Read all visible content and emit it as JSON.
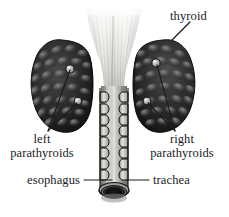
{
  "figure": {
    "background_color": "#ffffff",
    "width": 229,
    "height": 217,
    "style": "grayscale anatomical engraving"
  },
  "labels": {
    "thyroid": "thyroid",
    "left_parathyroids_line1": "left",
    "left_parathyroids_line2": "parathyroids",
    "right_parathyroids_line1": "right",
    "right_parathyroids_line2": "parathyroids",
    "esophagus": "esophagus",
    "trachea": "trachea"
  },
  "colors": {
    "text": "#1a1a1a",
    "leader_line": "#1c1c1c",
    "thyroid_lobe_dark": "#1b1b1b",
    "thyroid_lobe_mid": "#3a3a3a",
    "thyroid_lobe_highlight": "#6e6e6e",
    "cartilage_light": "#d8d8d4",
    "cartilage_mid": "#a9a9a5",
    "trachea_tube": "#8e8e8a",
    "trachea_tube_highlight": "#cfcfcb",
    "trachea_lumen": "#0d0d0d",
    "parathyroid_nodule": "#b9b9b4",
    "outline": "#1a1a1a"
  },
  "structures": [
    {
      "name": "thyroid-cartilage-funnel",
      "label": "thyroid",
      "description": "Flared fibrous funnel-shaped cartilage at top with vertical striations",
      "position": "top-center"
    },
    {
      "name": "thyroid-lobe-left",
      "label": "thyroid",
      "description": "Dark lobulated glandular mass on viewer-left side",
      "position": "upper-left"
    },
    {
      "name": "thyroid-lobe-right",
      "label": "thyroid",
      "description": "Dark lobulated glandular mass on viewer-right side",
      "position": "upper-right"
    },
    {
      "name": "parathyroid-left-superior",
      "label": "left parathyroids",
      "description": "Pale round nodule embedded in left lobe, superior",
      "position": "left-lobe-upper"
    },
    {
      "name": "parathyroid-left-inferior",
      "label": "left parathyroids",
      "description": "Pale round nodule embedded in left lobe, inferior",
      "position": "left-lobe-lower"
    },
    {
      "name": "parathyroid-right-superior",
      "label": "right parathyroids",
      "description": "Pale round nodule embedded in right lobe, superior",
      "position": "right-lobe-upper"
    },
    {
      "name": "parathyroid-right-inferior",
      "label": "right parathyroids",
      "description": "Pale round nodule embedded in right lobe, inferior",
      "position": "right-lobe-lower"
    },
    {
      "name": "trachea-tube",
      "label": "trachea",
      "description": "Vertical cylindrical airway with stacked cartilage rings on both edges",
      "position": "center-lower"
    },
    {
      "name": "trachea-lumen",
      "label": "trachea",
      "description": "Dark elliptical opening at cut bottom end of trachea",
      "position": "bottom-center"
    },
    {
      "name": "esophagus",
      "label": "esophagus",
      "description": "Tube lying behind the trachea, indicated by leader at lower left",
      "position": "center-lower-behind"
    }
  ],
  "annotations": [
    {
      "id": "thyroid",
      "text": "thyroid",
      "text_x": 170,
      "text_y": 18,
      "leader_from": [
        190,
        22
      ],
      "leader_to": [
        171,
        41
      ]
    },
    {
      "id": "left-parathyroids",
      "text": "left parathyroids",
      "text_x": 12,
      "text_y": 140,
      "leader_from": [
        48,
        131
      ],
      "leader_to": [
        70,
        96
      ]
    },
    {
      "id": "right-parathyroids",
      "text": "right parathyroids",
      "text_x": 148,
      "text_y": 140,
      "leader_from": [
        175,
        131
      ],
      "leader_to": [
        155,
        101
      ]
    },
    {
      "id": "esophagus",
      "text": "esophagus",
      "text_x": 30,
      "text_y": 184,
      "leader_from": [
        84,
        180
      ],
      "leader_to": [
        110,
        180
      ]
    },
    {
      "id": "trachea",
      "text": "trachea",
      "text_x": 152,
      "text_y": 184,
      "leader_from": [
        148,
        180
      ],
      "leader_to": [
        127,
        180
      ]
    }
  ]
}
